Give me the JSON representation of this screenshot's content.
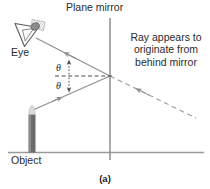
{
  "figure": {
    "caption": "(a)",
    "labels": {
      "plane_mirror": "Plane mirror",
      "ray_note": "Ray appears to originate from behind mirror",
      "eye": "Eye",
      "object": "Object",
      "theta_incident": "θ",
      "theta_reflected": "θ"
    },
    "colors": {
      "ink": "#2b2b2b",
      "ray": "#8e8e8e",
      "mirror": "#8e8e8e",
      "ground": "#9a9a9a",
      "object_body": "#6b6b6b",
      "object_tip": "#d9d9d9",
      "eye_fill": "#ffffff",
      "eye_shade": "#9a9a9a",
      "background": "#ffffff"
    },
    "geometry": {
      "mirror_x": 110,
      "mirror_top_y": 18,
      "mirror_bottom_y": 160,
      "reflection_point": [
        110,
        76
      ],
      "ground_y": 152,
      "ground_x0": 8,
      "ground_x1": 204,
      "object_x": 32,
      "object_top_y": 106,
      "object_bottom_y": 152,
      "eye_center": [
        30,
        32
      ],
      "virtual_ray_end": [
        196,
        118
      ],
      "normal_x0": 56,
      "normal_x1": 112
    },
    "elements": [
      "eye-symbol",
      "object-candle",
      "plane-mirror-line",
      "ground-line",
      "incident-ray",
      "reflected-ray",
      "virtual-ray-dashed",
      "normal-dashed-line",
      "angle-markers"
    ]
  }
}
